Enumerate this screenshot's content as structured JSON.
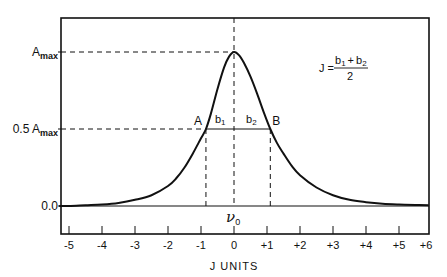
{
  "chart_data": {
    "type": "line",
    "title": "",
    "xlabel": "J UNITS",
    "ylabel": "",
    "xlim": [
      -5.3,
      5.9
    ],
    "ylim": [
      -0.15,
      1.25
    ],
    "grid": false,
    "x_ticks": [
      -5,
      -4,
      -3,
      -2,
      -1,
      0,
      1,
      2,
      3,
      4,
      5,
      6
    ],
    "x_tick_labels": [
      "-5",
      "-4",
      "-3",
      "-2",
      "-1",
      "0",
      "+1",
      "+2",
      "+3",
      "+4",
      "+5",
      "+6"
    ],
    "y_tick_labels": [
      {
        "value": 1.0,
        "label_main": "A",
        "label_sub": "max"
      },
      {
        "value": 0.5,
        "label_main": "0.5 A",
        "label_sub": "max"
      },
      {
        "value": 0.0,
        "label_main": "0.0",
        "label_sub": ""
      }
    ],
    "series": [
      {
        "name": "absorption band",
        "x": [
          -5.3,
          -5,
          -4.5,
          -4,
          -3.5,
          -3,
          -2.5,
          -2,
          -1.75,
          -1.5,
          -1.25,
          -1.0,
          -0.85,
          -0.7,
          -0.5,
          -0.3,
          -0.15,
          0,
          0.15,
          0.3,
          0.5,
          0.7,
          0.9,
          1.1,
          1.3,
          1.5,
          1.75,
          2.0,
          2.5,
          3.0,
          3.5,
          4.0,
          4.5,
          5.0,
          5.5,
          5.9
        ],
        "y": [
          0.0,
          0.0,
          0.005,
          0.01,
          0.02,
          0.04,
          0.07,
          0.13,
          0.18,
          0.25,
          0.34,
          0.44,
          0.5,
          0.6,
          0.76,
          0.9,
          0.97,
          1.0,
          0.98,
          0.93,
          0.84,
          0.73,
          0.61,
          0.5,
          0.41,
          0.34,
          0.26,
          0.2,
          0.12,
          0.07,
          0.04,
          0.025,
          0.015,
          0.01,
          0.007,
          0.005
        ]
      }
    ],
    "annotations": {
      "peak_label": "ν",
      "peak_label_sub": "0",
      "point_a": {
        "label": "A",
        "x": -0.85,
        "y": 0.5
      },
      "point_b": {
        "label": "B",
        "x": 1.1,
        "y": 0.5
      },
      "segment_b1": "b",
      "segment_b1_sub": "1",
      "segment_b2": "b",
      "segment_b2_sub": "2",
      "formula": {
        "lhs": "J =",
        "numerator_b1": "b",
        "numerator_b1_sub": "1",
        "plus": "+",
        "numerator_b2": "b",
        "numerator_b2_sub": "2",
        "denominator": "2"
      }
    }
  }
}
